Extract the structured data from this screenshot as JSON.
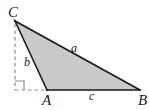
{
  "figure": {
    "kind": "geometry-diagram",
    "background_color": "#ffffff",
    "fill_color": "#c9c9c9",
    "stroke_color": "#1a1a1a",
    "dash_color": "#8c8c8c"
  },
  "vertices": [
    {
      "name": "C",
      "label": "C",
      "x": 15,
      "y": 21
    },
    {
      "name": "A",
      "label": "A",
      "x": 47,
      "y": 90
    },
    {
      "name": "B",
      "label": "B",
      "x": 140,
      "y": 90
    }
  ],
  "sides": [
    {
      "name": "a",
      "label": "a",
      "from": "C",
      "to": "B"
    },
    {
      "name": "b",
      "label": "b",
      "from": "C",
      "to": "A"
    },
    {
      "name": "c",
      "label": "c",
      "from": "A",
      "to": "B"
    }
  ],
  "construction": {
    "dashed_vertical": {
      "from_x": 15,
      "from_y": 21,
      "to_x": 15,
      "to_y": 90
    },
    "dashed_horizontal": {
      "from_x": 15,
      "from_y": 90,
      "to_x": 47,
      "to_y": 90
    },
    "right_angle_marker": {
      "x": 15,
      "y": 90,
      "size": 9,
      "label": "right-angle"
    }
  }
}
